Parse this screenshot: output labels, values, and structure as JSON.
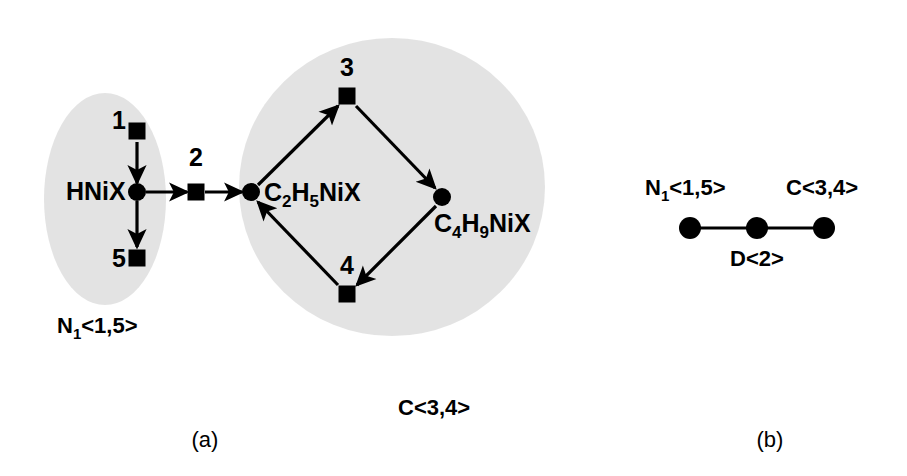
{
  "figure": {
    "width": 907,
    "height": 476,
    "background": "#ffffff",
    "ink_color": "#000000",
    "blob_color": "#d8d8d8"
  },
  "panels": [
    {
      "id": "a",
      "caption": "(a)",
      "caption_x": 205,
      "caption_y": 447
    },
    {
      "id": "b",
      "caption": "(b)",
      "caption_x": 770,
      "caption_y": 447
    }
  ],
  "panel_a": {
    "groups": [
      {
        "name": "group-n1",
        "label": "N",
        "label_sub": "1",
        "label_rest": "<1,5>",
        "label_x": 57,
        "label_y": 333,
        "blob_cx": 105,
        "blob_cy": 199,
        "blob_rx": 61,
        "blob_ry": 106
      },
      {
        "name": "group-c",
        "label": "C<3,4>",
        "label_sub": "",
        "label_rest": "",
        "label_x": 398,
        "label_y": 415,
        "blob_cx": 392,
        "blob_cy": 187,
        "blob_rx": 153,
        "blob_ry": 149
      }
    ],
    "species_nodes": [
      {
        "name": "hnix",
        "shape": "circle",
        "x": 137,
        "y": 192,
        "r": 9,
        "label": "HNiX",
        "label_sub": "",
        "label_rest": "",
        "label_x": 66,
        "label_y": 200,
        "label_anchor": "start"
      },
      {
        "name": "c2h5nix",
        "shape": "circle",
        "x": 251,
        "y": 192,
        "r": 9,
        "label": "C",
        "label_sub": "2",
        "label_rest": "H",
        "label_sub2": "5",
        "label_rest2": "NiX",
        "label_x": 264,
        "label_y": 201,
        "label_anchor": "start"
      },
      {
        "name": "c4h9nix",
        "shape": "circle",
        "x": 442,
        "y": 197,
        "r": 9,
        "label": "C",
        "label_sub": "4",
        "label_rest": "H",
        "label_sub2": "9",
        "label_rest2": "NiX",
        "label_x": 434,
        "label_y": 232,
        "label_anchor": "start"
      }
    ],
    "reaction_nodes": [
      {
        "name": "reaction-1",
        "shape": "square",
        "x": 137,
        "y": 131,
        "size": 17,
        "label": "1",
        "label_x": 119,
        "label_y": 129
      },
      {
        "name": "reaction-2",
        "shape": "square",
        "x": 196,
        "y": 192,
        "size": 17,
        "label": "2",
        "label_x": 196,
        "label_y": 166
      },
      {
        "name": "reaction-3",
        "shape": "square",
        "x": 347,
        "y": 96,
        "size": 17,
        "label": "3",
        "label_x": 347,
        "label_y": 76
      },
      {
        "name": "reaction-4",
        "shape": "square",
        "x": 347,
        "y": 294,
        "size": 17,
        "label": "4",
        "label_x": 347,
        "label_y": 274
      },
      {
        "name": "reaction-5",
        "shape": "square",
        "x": 137,
        "y": 258,
        "size": 17,
        "label": "5",
        "label_x": 119,
        "label_y": 267
      }
    ],
    "edges": [
      {
        "name": "edge-1-to-hnix",
        "from": "reaction-1",
        "to": "hnix",
        "x1": 137,
        "y1": 142,
        "x2": 137,
        "y2": 183
      },
      {
        "name": "edge-hnix-to-5",
        "from": "hnix",
        "to": "reaction-5",
        "x1": 137,
        "y1": 201,
        "x2": 137,
        "y2": 247
      },
      {
        "name": "edge-hnix-to-2",
        "from": "hnix",
        "to": "reaction-2",
        "x1": 146,
        "y1": 192,
        "x2": 187,
        "y2": 192
      },
      {
        "name": "edge-2-to-c2h5nix",
        "from": "reaction-2",
        "to": "c2h5nix",
        "x1": 205,
        "y1": 192,
        "x2": 242,
        "y2": 192
      },
      {
        "name": "edge-c2h5nix-to-3",
        "from": "c2h5nix",
        "to": "reaction-3",
        "x1": 258,
        "y1": 185,
        "x2": 338,
        "y2": 106
      },
      {
        "name": "edge-3-to-c4h9nix",
        "from": "reaction-3",
        "to": "c4h9nix",
        "x1": 356,
        "y1": 106,
        "x2": 435,
        "y2": 188
      },
      {
        "name": "edge-c4h9nix-to-4",
        "from": "c4h9nix",
        "to": "reaction-4",
        "x1": 436,
        "y1": 206,
        "x2": 357,
        "y2": 285
      },
      {
        "name": "edge-4-to-c2h5nix",
        "from": "reaction-4",
        "to": "c2h5nix",
        "x1": 338,
        "y1": 285,
        "x2": 258,
        "y2": 202
      }
    ]
  },
  "panel_b": {
    "nodes": [
      {
        "name": "node-n1",
        "x": 690,
        "y": 228,
        "r": 11,
        "label": "N",
        "label_sub": "1",
        "label_rest": "<1,5>",
        "label_x": 645,
        "label_y": 195,
        "label_anchor": "start"
      },
      {
        "name": "node-d",
        "x": 757,
        "y": 228,
        "r": 11,
        "label": "D<2>",
        "label_sub": "",
        "label_rest": "",
        "label_x": 757,
        "label_y": 266,
        "label_anchor": "middle"
      },
      {
        "name": "node-c",
        "x": 824,
        "y": 228,
        "r": 11,
        "label": "C<3,4>",
        "label_sub": "",
        "label_rest": "",
        "label_x": 786,
        "label_y": 195,
        "label_anchor": "start"
      }
    ],
    "edges": [
      {
        "name": "edge-n1-d",
        "x1": 690,
        "y1": 228,
        "x2": 757,
        "y2": 228
      },
      {
        "name": "edge-d-c",
        "x1": 757,
        "y1": 228,
        "x2": 824,
        "y2": 228
      }
    ]
  }
}
